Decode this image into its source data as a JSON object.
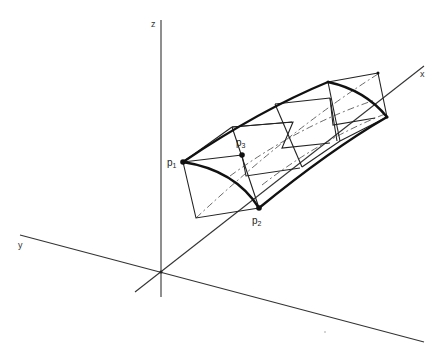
{
  "diagram": {
    "type": "3d-surface-patch",
    "axes": {
      "z_label": "z",
      "x_label": "x",
      "y_label": "y"
    },
    "points": [
      {
        "id": "p1",
        "base": "p",
        "sub": "1"
      },
      {
        "id": "p2",
        "base": "p",
        "sub": "2"
      },
      {
        "id": "p3",
        "base": "p",
        "sub": "3"
      }
    ],
    "colors": {
      "background": "#ffffff",
      "lines": "#222222"
    }
  }
}
